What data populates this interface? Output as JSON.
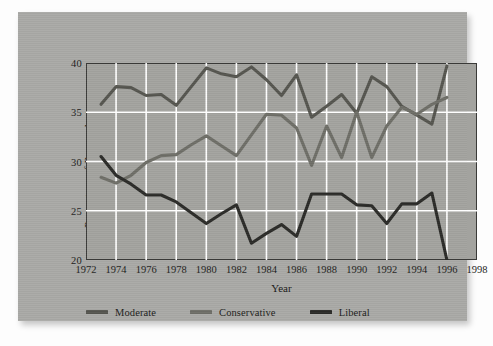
{
  "card": {
    "background_color": "#a9a9a6",
    "plot_background_color": "#a3a39f",
    "frame_color": "#3a3a38",
    "grid_color": "#ffffff"
  },
  "axis": {
    "y_title": "Percentage of Respondents",
    "x_title": "Year",
    "y_ticks": [
      "20",
      "25",
      "30",
      "35",
      "40"
    ],
    "x_ticks": [
      "1972",
      "1974",
      "1976",
      "1978",
      "1980",
      "1982",
      "1984",
      "1986",
      "1988",
      "1990",
      "1992",
      "1994",
      "1996",
      "1998"
    ]
  },
  "legend": {
    "items": [
      {
        "label": "Moderate",
        "color": "#55554f"
      },
      {
        "label": "Conservative",
        "color": "#6e6e67"
      },
      {
        "label": "Liberal",
        "color": "#2b2b28"
      }
    ]
  },
  "chart_data": {
    "type": "line",
    "title": "",
    "subtitle": "",
    "xlabel": "Year",
    "ylabel": "Percentage of Respondents",
    "xlim": [
      1972,
      1998
    ],
    "ylim": [
      20,
      40
    ],
    "xticks": [
      1972,
      1974,
      1976,
      1978,
      1980,
      1982,
      1984,
      1986,
      1988,
      1990,
      1992,
      1994,
      1996,
      1998
    ],
    "yticks": [
      20,
      25,
      30,
      35,
      40
    ],
    "grid": true,
    "legend_position": "below",
    "x": [
      1973,
      1974,
      1975,
      1976,
      1977,
      1978,
      1979,
      1980,
      1981,
      1982,
      1983,
      1984,
      1985,
      1986,
      1987,
      1988,
      1989,
      1990,
      1991,
      1992,
      1993,
      1994,
      1995,
      1996
    ],
    "series": [
      {
        "name": "Moderate",
        "color": "#55554f",
        "values": [
          35.8,
          37.6,
          37.5,
          36.7,
          36.8,
          35.7,
          37.6,
          39.5,
          38.9,
          38.6,
          39.6,
          38.3,
          36.7,
          38.8,
          34.5,
          35.6,
          36.8,
          34.9,
          38.6,
          37.6,
          35.6,
          34.7,
          33.8,
          39.7
        ]
      },
      {
        "name": "Conservative",
        "color": "#6e6e67",
        "values": [
          28.4,
          27.8,
          28.6,
          29.9,
          30.6,
          30.7,
          31.7,
          32.6,
          31.6,
          30.6,
          32.7,
          34.8,
          34.7,
          33.4,
          29.6,
          33.6,
          30.4,
          35.0,
          30.4,
          33.6,
          35.5,
          34.8,
          35.8,
          36.5
        ]
      },
      {
        "name": "Liberal",
        "color": "#2b2b28",
        "values": [
          30.5,
          28.6,
          27.7,
          26.6,
          26.6,
          25.9,
          24.8,
          23.7,
          24.7,
          25.6,
          21.7,
          22.7,
          23.6,
          22.4,
          26.7,
          26.7,
          26.7,
          25.6,
          25.5,
          23.7,
          25.7,
          25.7,
          26.8,
          20.0
        ]
      }
    ]
  }
}
